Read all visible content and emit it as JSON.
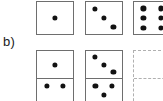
{
  "figure": {
    "part_label": "b)",
    "background_color": "#ffffff",
    "tile_border_color": "#6e6e6e",
    "pip_color": "#121212",
    "placeholder_border_color": "#b0b0b0",
    "rows": [
      {
        "name": "top-row",
        "kind": "single-squares",
        "tiles": [
          {
            "id": "top-1",
            "style": "solid",
            "pip_count": 1,
            "pattern": "center",
            "pips": [
              {
                "x": 50,
                "y": 50
              }
            ]
          },
          {
            "id": "top-2",
            "style": "solid",
            "pip_count": 3,
            "pattern": "diagonal",
            "pips": [
              {
                "x": 24,
                "y": 22
              },
              {
                "x": 50,
                "y": 50
              },
              {
                "x": 76,
                "y": 78
              }
            ]
          },
          {
            "id": "top-3",
            "style": "solid",
            "pip_count": 6,
            "pattern": "two-columns-of-three",
            "clipped": "right-edge",
            "pips": [
              {
                "x": 26,
                "y": 20
              },
              {
                "x": 74,
                "y": 20
              },
              {
                "x": 26,
                "y": 50
              },
              {
                "x": 74,
                "y": 50
              },
              {
                "x": 26,
                "y": 80
              },
              {
                "x": 74,
                "y": 80
              }
            ]
          }
        ]
      },
      {
        "name": "bottom-row",
        "kind": "dominoes",
        "tiles": [
          {
            "id": "bot-1",
            "style": "solid",
            "upper_pip_count": 1,
            "lower_pip_count": 2,
            "upper_pattern": "center",
            "lower_pattern": "two-side-by-side",
            "clipped": "bottom-edge",
            "upper_pips": [
              {
                "x": 50,
                "y": 50
              }
            ],
            "lower_pips": [
              {
                "x": 27,
                "y": 30
              },
              {
                "x": 73,
                "y": 30
              }
            ]
          },
          {
            "id": "bot-2",
            "style": "solid",
            "upper_pip_count": 3,
            "lower_pip_count": 3,
            "upper_pattern": "diagonal",
            "lower_pattern": "diagonal",
            "clipped": "bottom-edge",
            "upper_pips": [
              {
                "x": 24,
                "y": 22
              },
              {
                "x": 50,
                "y": 50
              },
              {
                "x": 76,
                "y": 78
              }
            ],
            "lower_pips": [
              {
                "x": 26,
                "y": 28
              },
              {
                "x": 72,
                "y": 28
              },
              {
                "x": 50,
                "y": 62
              }
            ]
          },
          {
            "id": "bot-3",
            "style": "dashed",
            "upper_pip_count": 0,
            "lower_pip_count": 0,
            "upper_pattern": "empty",
            "lower_pattern": "empty",
            "clipped": "right-and-bottom-edge",
            "upper_pips": [],
            "lower_pips": []
          }
        ]
      }
    ]
  }
}
